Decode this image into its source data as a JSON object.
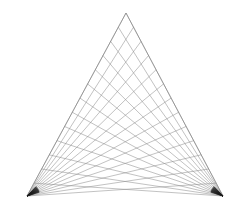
{
  "figure": {
    "type": "line-art",
    "canvas": {
      "width": 248,
      "height": 209,
      "background": "#ffffff"
    },
    "stroke": {
      "color": "#8a8a8a",
      "width": 0.55,
      "opacity": 0.95,
      "edge_color": "#7a7a7a",
      "edge_width": 0.6
    },
    "vertices": {
      "apex": {
        "label": "A",
        "x": 126,
        "y": 13
      },
      "bottom_left": {
        "label": "B",
        "x": 27,
        "y": 196
      },
      "bottom_right": {
        "label": "C",
        "x": 223,
        "y": 196
      }
    },
    "construction": {
      "description": "Two pencils of lines. Family A radiates from the bottom-left vertex to evenly spaced division points along the right edge (apex to bottom-right). Family B radiates from the bottom-right vertex to evenly spaced division points along the left edge (apex to bottom-left). Their intersections trace a parabolic envelope.",
      "divisions": 13,
      "families": [
        {
          "name": "family-a",
          "origin": "bottom_left",
          "target_edge": [
            "apex",
            "bottom_right"
          ],
          "count": 13
        },
        {
          "name": "family-b",
          "origin": "bottom_right",
          "target_edge": [
            "apex",
            "bottom_left"
          ],
          "count": 13
        }
      ],
      "show_outline_edges": true
    }
  },
  "chart_data": {
    "type": "line",
    "xlabel": "",
    "ylabel": "",
    "xlim": [
      0,
      248
    ],
    "ylim": [
      209,
      0
    ],
    "grid": false,
    "legend": "none",
    "series": [
      {
        "name": "family-a",
        "note": "lines from bottom-left vertex (27,196) to 13 points on right edge from apex (126,13) to (223,196)",
        "x": [
          27,
          27,
          27,
          27,
          27,
          27,
          27,
          27,
          27,
          27,
          27,
          27,
          27
        ],
        "y": [
          196,
          196,
          196,
          196,
          196,
          196,
          196,
          196,
          196,
          196,
          196,
          196,
          196
        ],
        "x_end": [
          126,
          134,
          141,
          149,
          156,
          164,
          172,
          179,
          187,
          194,
          202,
          209,
          217
        ],
        "y_end": [
          13,
          28,
          42,
          57,
          71,
          85,
          100,
          114,
          128,
          143,
          157,
          172,
          186
        ]
      },
      {
        "name": "family-b",
        "note": "lines from bottom-right vertex (223,196) to 13 points on left edge from apex (126,13) to (27,196)",
        "x": [
          223,
          223,
          223,
          223,
          223,
          223,
          223,
          223,
          223,
          223,
          223,
          223,
          223
        ],
        "y": [
          196,
          196,
          196,
          196,
          196,
          196,
          196,
          196,
          196,
          196,
          196,
          196,
          196
        ],
        "x_end": [
          126,
          118,
          110,
          103,
          95,
          87,
          80,
          72,
          64,
          57,
          49,
          41,
          34
        ],
        "y_end": [
          13,
          28,
          42,
          57,
          71,
          85,
          100,
          114,
          128,
          143,
          157,
          172,
          186
        ]
      }
    ]
  }
}
